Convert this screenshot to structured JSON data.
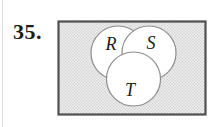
{
  "problem": {
    "number": "35."
  },
  "venn": {
    "sets": [
      {
        "label": "R"
      },
      {
        "label": "S"
      },
      {
        "label": "T"
      }
    ]
  },
  "colors": {
    "page_bg": "#ffffff",
    "edge_line": "#dcdcdc",
    "number_color": "#1c1c1c",
    "universal_fill": "#ececec",
    "universal_dot": "#c6c6c6",
    "rect_border": "#4f4f4f",
    "circle_stroke": "#8e8e8e",
    "circle_fill": "#ffffff",
    "label_color": "#1c1c1c"
  }
}
